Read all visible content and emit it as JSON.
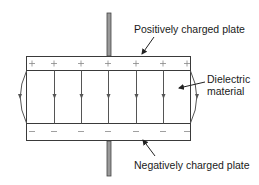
{
  "diagram": {
    "labels": {
      "positive_plate": "Positively charged plate",
      "dielectric_line1": "Dielectric",
      "dielectric_line2": "material",
      "negative_plate": "Negatively charged plate"
    },
    "plate_symbols": {
      "positive": "+",
      "negative": "–"
    },
    "charge_marks_count": 7,
    "field_lines_count": 5,
    "fringe_lines": [
      "left",
      "right"
    ],
    "colors": {
      "line": "#3a3a3a",
      "lead_fill": "#9a9a9a",
      "symbol": "#888888",
      "text": "#1a1a1a"
    }
  }
}
